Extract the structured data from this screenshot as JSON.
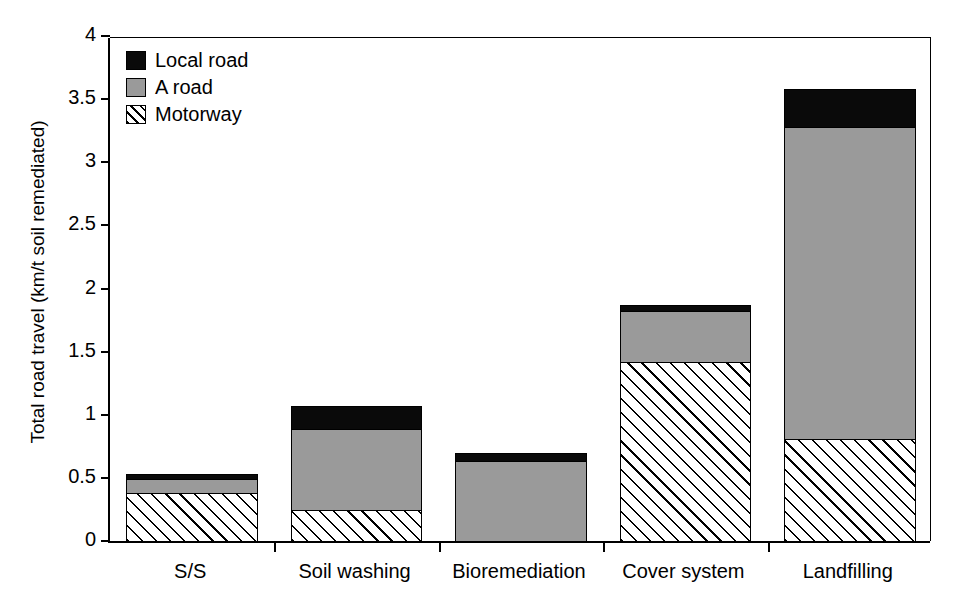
{
  "chart_data": {
    "type": "bar",
    "stacked": true,
    "title": "",
    "xlabel": "",
    "ylabel": "Total road travel (km/t soil remediated)",
    "categories": [
      "S/S",
      "Soil washing",
      "Bioremediation",
      "Cover system",
      "Landfilling"
    ],
    "series": [
      {
        "name": "Motorway",
        "color": "#ffffff",
        "pattern": "diagonal-hatch",
        "values": [
          0.38,
          0.245,
          0.0,
          1.42,
          0.81
        ]
      },
      {
        "name": "A road",
        "color": "#9a9a9a",
        "pattern": "solid",
        "values": [
          0.11,
          0.645,
          0.63,
          0.4,
          2.47
        ]
      },
      {
        "name": "Local road",
        "color": "#0a0a0a",
        "pattern": "solid",
        "values": [
          0.04,
          0.18,
          0.07,
          0.05,
          0.3
        ]
      }
    ],
    "totals": [
      0.53,
      1.07,
      0.7,
      1.87,
      3.58
    ],
    "ylim": [
      0,
      4
    ],
    "yticks": [
      0,
      0.5,
      1,
      1.5,
      2,
      2.5,
      3,
      3.5,
      4
    ],
    "ytick_labels": [
      "0",
      "0.5",
      "1",
      "1.5",
      "2",
      "2.5",
      "3",
      "3.5",
      "4"
    ],
    "grid": false,
    "legend_position": "top-left",
    "legend_order": [
      "Local road",
      "A road",
      "Motorway"
    ]
  },
  "legend": {
    "items": [
      {
        "label": "Local road",
        "key": "local"
      },
      {
        "label": "A road",
        "key": "aroad"
      },
      {
        "label": "Motorway",
        "key": "motorway"
      }
    ]
  },
  "axis": {
    "y_title": "Total road travel (km/t soil remediated)"
  }
}
